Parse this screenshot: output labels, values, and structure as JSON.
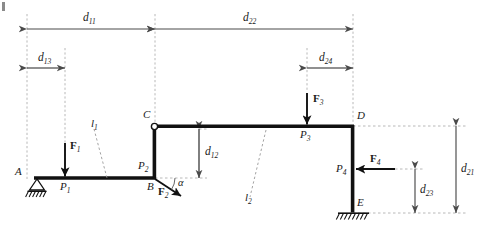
{
  "figure": {
    "background": "#ffffff",
    "width": 234,
    "colors": {
      "member": "#111111",
      "dimension": "#555555",
      "extension": "#a8a8a8",
      "force": "#111111",
      "guide": "#9a9a9a"
    }
  },
  "dimensions": [
    {
      "key": "d11",
      "base": "d",
      "sub": "11",
      "orientation": "horizontal"
    },
    {
      "key": "d22",
      "base": "d",
      "sub": "22",
      "orientation": "horizontal"
    },
    {
      "key": "d13",
      "base": "d",
      "sub": "13",
      "orientation": "horizontal"
    },
    {
      "key": "d24",
      "base": "d",
      "sub": "24",
      "orientation": "horizontal"
    },
    {
      "key": "d12",
      "base": "d",
      "sub": "12",
      "orientation": "vertical"
    },
    {
      "key": "d21",
      "base": "d",
      "sub": "21",
      "orientation": "vertical"
    },
    {
      "key": "d23",
      "base": "d",
      "sub": "23",
      "orientation": "vertical"
    }
  ],
  "nodes": [
    {
      "key": "A",
      "label": "A",
      "support": "pin-roller"
    },
    {
      "key": "B",
      "label": "B",
      "support": "none"
    },
    {
      "key": "C",
      "label": "C",
      "support": "hinge"
    },
    {
      "key": "D",
      "label": "D",
      "support": "none"
    },
    {
      "key": "E",
      "label": "E",
      "support": "fixed"
    }
  ],
  "forces": [
    {
      "key": "F1",
      "base": "F",
      "sub": "1",
      "direction": "down",
      "point": "P1"
    },
    {
      "key": "F2",
      "base": "F",
      "sub": "2",
      "direction": "down-right",
      "point": "P2"
    },
    {
      "key": "F3",
      "base": "F",
      "sub": "3",
      "direction": "down",
      "point": "P3"
    },
    {
      "key": "F4",
      "base": "F",
      "sub": "4",
      "direction": "left",
      "point": "P4"
    }
  ],
  "load_points": [
    {
      "key": "P1",
      "base": "P",
      "sub": "1"
    },
    {
      "key": "P2",
      "base": "P",
      "sub": "2"
    },
    {
      "key": "P3",
      "base": "P",
      "sub": "3"
    },
    {
      "key": "P4",
      "base": "P",
      "sub": "4"
    }
  ],
  "reference_lines": [
    {
      "key": "l1",
      "base": "l",
      "sub": "1"
    },
    {
      "key": "l2",
      "base": "l",
      "sub": "2"
    }
  ],
  "angles": [
    {
      "key": "alpha",
      "symbol": "α"
    }
  ],
  "labels": {
    "d11": "d",
    "d11_sub": "11",
    "d22": "d",
    "d22_sub": "22",
    "d13": "d",
    "d13_sub": "13",
    "d24": "d",
    "d24_sub": "24",
    "d12": "d",
    "d12_sub": "12",
    "d21": "d",
    "d21_sub": "21",
    "d23": "d",
    "d23_sub": "23",
    "A": "A",
    "B": "B",
    "C": "C",
    "D": "D",
    "E": "E",
    "F1": "F",
    "F1_sub": "1",
    "F2": "F",
    "F2_sub": "2",
    "F3": "F",
    "F3_sub": "3",
    "F4": "F",
    "F4_sub": "4",
    "P1": "P",
    "P1_sub": "1",
    "P2": "P",
    "P2_sub": "2",
    "P3": "P",
    "P3_sub": "3",
    "P4": "P",
    "P4_sub": "4",
    "l1": "l",
    "l1_sub": "1",
    "l2": "l",
    "l2_sub": "2",
    "alpha": "α"
  }
}
